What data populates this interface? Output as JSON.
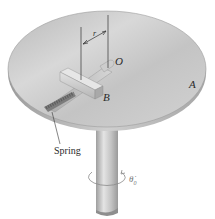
{
  "diagram": {
    "labels": {
      "center": "O",
      "slider": "B",
      "disk": "A",
      "radius": "r",
      "spring": "Spring",
      "angular_velocity": "θ̇",
      "angular_velocity_sub": "0"
    },
    "colors": {
      "disk_top": "#c9c9c9",
      "disk_edge": "#a8a8a8",
      "shaft": "#bdbdbd",
      "slider": "#cfcfcf",
      "spring": "#8a8a8a",
      "line": "#333333",
      "text": "#2a2a2a"
    }
  }
}
